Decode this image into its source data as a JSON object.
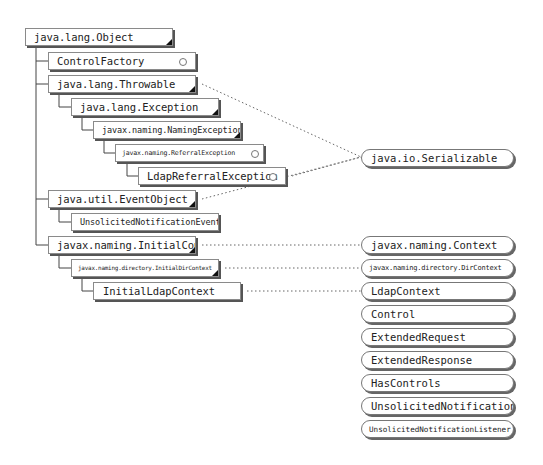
{
  "diagram": {
    "type": "class-hierarchy",
    "classes": [
      {
        "id": "object",
        "label": "java.lang.Object",
        "abstract": true
      },
      {
        "id": "controlfactory",
        "label": "ControlFactory",
        "abstract": false,
        "parent": "object"
      },
      {
        "id": "throwable",
        "label": "java.lang.Throwable",
        "abstract": true,
        "parent": "object"
      },
      {
        "id": "exception",
        "label": "java.lang.Exception",
        "abstract": true,
        "parent": "throwable"
      },
      {
        "id": "namingexception",
        "label": "javax.naming.NamingException",
        "abstract": true,
        "parent": "exception"
      },
      {
        "id": "referralexception",
        "label": "javax.naming.ReferralException",
        "abstract": false,
        "parent": "namingexception"
      },
      {
        "id": "ldapreferralexception",
        "label": "LdapReferralException",
        "abstract": false,
        "parent": "referralexception"
      },
      {
        "id": "eventobject",
        "label": "java.util.EventObject",
        "abstract": true,
        "parent": "object"
      },
      {
        "id": "unsolicitednotificationevent",
        "label": "UnsolicitedNotificationEvent",
        "abstract": false,
        "parent": "eventobject"
      },
      {
        "id": "initialcontext",
        "label": "javax.naming.InitialContext",
        "abstract": true,
        "parent": "object"
      },
      {
        "id": "initialdircontext",
        "label": "javax.naming.directory.InitialDirContext",
        "abstract": true,
        "parent": "initialcontext"
      },
      {
        "id": "initialldapcontext",
        "label": "InitialLdapContext",
        "abstract": false,
        "parent": "initialdircontext"
      }
    ],
    "interfaces": [
      {
        "id": "serializable",
        "label": "java.io.Serializable"
      },
      {
        "id": "context",
        "label": "javax.naming.Context"
      },
      {
        "id": "dircontext",
        "label": "javax.naming.directory.DirContext"
      },
      {
        "id": "ldapcontext",
        "label": "LdapContext"
      },
      {
        "id": "control",
        "label": "Control"
      },
      {
        "id": "extendedrequest",
        "label": "ExtendedRequest"
      },
      {
        "id": "extendedresponse",
        "label": "ExtendedResponse"
      },
      {
        "id": "hascontrols",
        "label": "HasControls"
      },
      {
        "id": "unsolicitednotification",
        "label": "UnsolicitedNotification"
      },
      {
        "id": "unsolicitednotificationlistener",
        "label": "UnsolicitedNotificationListener"
      }
    ],
    "implements": [
      {
        "from": "throwable",
        "to": "serializable"
      },
      {
        "from": "ldapreferralexception",
        "to": "serializable"
      },
      {
        "from": "eventobject",
        "to": "serializable"
      },
      {
        "from": "initialcontext",
        "to": "context"
      },
      {
        "from": "initialdircontext",
        "to": "dircontext"
      },
      {
        "from": "initialldapcontext",
        "to": "ldapcontext"
      }
    ],
    "colors": {
      "box_border": "#8a8a8a",
      "shadow": "#555555",
      "line": "#333333",
      "dotted": "#666666"
    }
  }
}
